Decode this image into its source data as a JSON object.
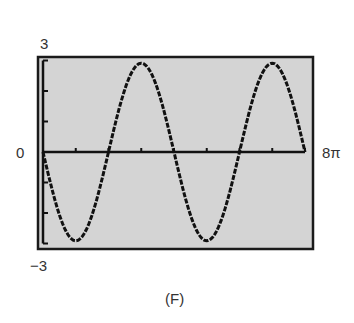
{
  "chart_data": {
    "type": "line",
    "title": "",
    "caption": "(F)",
    "function": "y = -3 sin(x/2)",
    "xlabel": "",
    "ylabel": "",
    "xlim": [
      0,
      25.1327
    ],
    "ylim": [
      -3,
      3
    ],
    "x_tick_labels": [
      "0",
      "8π"
    ],
    "y_tick_labels": [
      "3",
      "-3"
    ],
    "x_ticks_every": "π",
    "y_ticks_every": 1,
    "grid": false,
    "legend": null,
    "series": [
      {
        "name": "curve",
        "x": [
          "0",
          "π",
          "2π",
          "3π",
          "4π",
          "5π",
          "6π",
          "7π",
          "8π"
        ],
        "values": [
          0,
          -3,
          0,
          3,
          0,
          -3,
          0,
          3,
          0
        ]
      }
    ]
  },
  "labels": {
    "ymax": "3",
    "ymin": "−3",
    "xmin": "0",
    "xmax": "8π",
    "caption": "(F)"
  },
  "colors": {
    "plot_bg": "#d4d4d4",
    "frame": "#1a1a1a",
    "curve": "#111111"
  }
}
